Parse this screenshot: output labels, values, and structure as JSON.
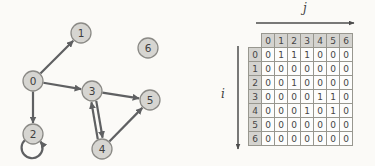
{
  "figure": {
    "colors": {
      "background": "#fbfaf7",
      "node_fill": "#d6d5d1",
      "node_stroke": "#8b8a86",
      "node_text": "#3e3e3e",
      "edge": "#5f6062",
      "axis_arrow": "#4d4d4d",
      "matrix_header_bg": "#d4d3cf",
      "matrix_cell_bg": "#fdfdfc",
      "matrix_border": "#98978f",
      "matrix_text": "#454545"
    },
    "graph": {
      "node_radius": 10,
      "nodes": [
        {
          "id": "0",
          "x": 33,
          "y": 81
        },
        {
          "id": "1",
          "x": 81,
          "y": 33
        },
        {
          "id": "2",
          "x": 33,
          "y": 134
        },
        {
          "id": "3",
          "x": 92,
          "y": 91
        },
        {
          "id": "4",
          "x": 102,
          "y": 149
        },
        {
          "id": "5",
          "x": 150,
          "y": 100
        },
        {
          "id": "6",
          "x": 148,
          "y": 48
        }
      ],
      "edges": [
        {
          "from": "0",
          "to": "1"
        },
        {
          "from": "0",
          "to": "3"
        },
        {
          "from": "0",
          "to": "2"
        },
        {
          "from": "2",
          "to": "2",
          "type": "self"
        },
        {
          "from": "3",
          "to": "5"
        },
        {
          "from": "3",
          "to": "4",
          "offset": -2.5
        },
        {
          "from": "4",
          "to": "3",
          "offset": -2.5
        },
        {
          "from": "4",
          "to": "5"
        }
      ]
    },
    "matrix": {
      "col_axis_label": "j",
      "row_axis_label": "i",
      "col_headers": [
        "0",
        "1",
        "2",
        "3",
        "4",
        "5",
        "6"
      ],
      "rows": [
        {
          "label": "0",
          "values": [
            0,
            1,
            1,
            1,
            0,
            0,
            0
          ]
        },
        {
          "label": "1",
          "values": [
            0,
            0,
            0,
            0,
            0,
            0,
            0
          ]
        },
        {
          "label": "2",
          "values": [
            0,
            0,
            1,
            0,
            0,
            0,
            0
          ]
        },
        {
          "label": "3",
          "values": [
            0,
            0,
            0,
            0,
            1,
            1,
            0
          ]
        },
        {
          "label": "4",
          "values": [
            0,
            0,
            0,
            1,
            0,
            1,
            0
          ]
        },
        {
          "label": "5",
          "values": [
            0,
            0,
            0,
            0,
            0,
            0,
            0
          ]
        },
        {
          "label": "6",
          "values": [
            0,
            0,
            0,
            0,
            0,
            0,
            0
          ]
        }
      ]
    }
  }
}
